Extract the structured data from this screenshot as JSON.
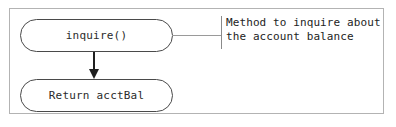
{
  "diagram": {
    "type": "uml-activity-fragment",
    "frame": {
      "name": "diagram-frame",
      "border_color": "#b3b3b3",
      "background": "#ffffff"
    },
    "nodes": [
      {
        "id": "inquire",
        "shape": "stadium",
        "label": "inquire()",
        "border_color": "#4a4a4a",
        "text_color": "#2b2b2b"
      },
      {
        "id": "return-acctbal",
        "shape": "stadium",
        "label": "Return acctBal",
        "border_color": "#4a4a4a",
        "text_color": "#2b2b2b"
      }
    ],
    "edges": [
      {
        "id": "inquire-to-return",
        "from": "inquire",
        "to": "return-acctbal",
        "style": "solid-arrow",
        "color": "#1f1f1f"
      },
      {
        "id": "inquire-to-note",
        "from": "inquire",
        "to": "note",
        "style": "plain-line",
        "color": "#9a9a9a"
      }
    ],
    "note": {
      "id": "note",
      "attached_to": "inquire",
      "border_color": "#8a8a8a",
      "text_color": "#232323",
      "lines": [
        "Method to inquire about",
        "the account balance"
      ]
    }
  }
}
